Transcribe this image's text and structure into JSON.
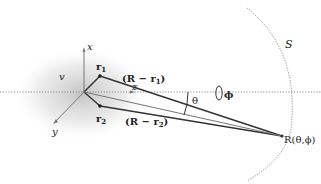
{
  "diagram": {
    "labels": {
      "x_axis": "x",
      "y_axis": "y",
      "z_axis": "z",
      "volume": "v",
      "r1": "r",
      "r1_sub": "1",
      "r2": "r",
      "r2_sub": "2",
      "R_minus_r1": "(R − r",
      "R_minus_r1_sub": "1",
      "R_minus_r1_close": ")",
      "R_minus_r2": "(R − r",
      "R_minus_r2_sub": "2",
      "R_minus_r2_close": ")",
      "theta": "θ",
      "phi": "ϕ",
      "sphere": "S",
      "observation_point": "R(θ,ϕ)"
    },
    "colors": {
      "line": "#333333",
      "thin_line": "#666666",
      "dotted": "#8a8a8a",
      "shade": "#c8c8c8"
    }
  }
}
